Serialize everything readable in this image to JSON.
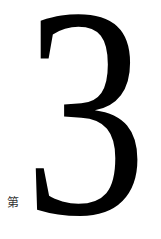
{
  "chapter": {
    "prefix": "第",
    "number": "3"
  },
  "colors": {
    "text": "#000000",
    "prefix_text": "#333333",
    "background": "#ffffff"
  }
}
